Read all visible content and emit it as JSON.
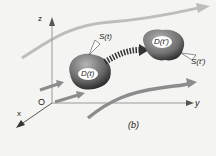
{
  "diagram": {
    "axes": {
      "z": "z",
      "y": "y",
      "x": "x",
      "origin": "O"
    },
    "regions": [
      {
        "label": "D(t)",
        "surface_label": "S(t)"
      },
      {
        "label": "D(t')",
        "surface_label": "S(t')"
      }
    ],
    "caption": "(b)",
    "colors": {
      "background": "#f4f4f2",
      "streamline": "#8c8c8c",
      "light_streamline": "#b9b9b9",
      "blob_dark": "#3a3a3a",
      "blob_light": "#9a9a9a"
    }
  }
}
